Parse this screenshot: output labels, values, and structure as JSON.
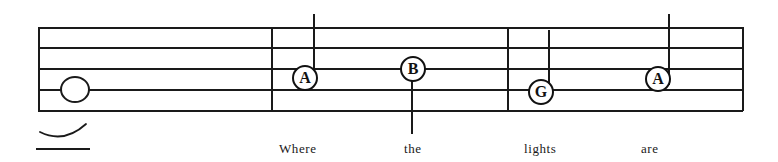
{
  "sheet": {
    "title": "music-staff-notation",
    "ink_color": "#1a1a1a",
    "paper_color": "#ffffff"
  },
  "staff": {
    "line_count": 5,
    "left_x": 38,
    "right_x": 743,
    "line_y": [
      27,
      47,
      68,
      89,
      110
    ],
    "barlines_x": [
      271,
      507
    ]
  },
  "notes": [
    {
      "id": "whole-note-start",
      "label": "",
      "kind": "whole-note",
      "x": 60,
      "y": 84,
      "has_tie": true
    },
    {
      "id": "note-a-1",
      "label": "A",
      "kind": "note-letter",
      "x": 300,
      "y": 77,
      "stem_direction": "up",
      "stem_x": 313,
      "stem_top": 14,
      "stem_bottom": 82
    },
    {
      "id": "note-b-1",
      "label": "B",
      "kind": "note-letter",
      "x": 405,
      "y": 68,
      "stem_direction": "down",
      "stem_x": 411,
      "stem_top": 72,
      "stem_bottom": 134
    },
    {
      "id": "note-g-1",
      "label": "G",
      "kind": "note-letter",
      "x": 535,
      "y": 91,
      "stem_direction": "up",
      "stem_x": 548,
      "stem_top": 30,
      "stem_bottom": 95
    },
    {
      "id": "note-a-2",
      "label": "A",
      "kind": "note-letter",
      "x": 645,
      "y": 79,
      "stem_direction": "up",
      "stem_x": 668,
      "stem_top": 14,
      "stem_bottom": 85
    }
  ],
  "lyrics": {
    "baseline_y": 141,
    "words": [
      {
        "text": "Where",
        "x": 279
      },
      {
        "text": "the",
        "x": 404
      },
      {
        "text": "lights",
        "x": 524
      },
      {
        "text": "are",
        "x": 641
      }
    ],
    "extender": {
      "x": 36,
      "y": 148,
      "width": 54
    }
  }
}
